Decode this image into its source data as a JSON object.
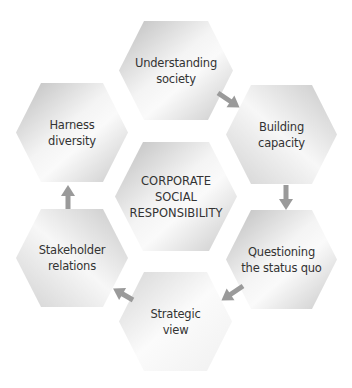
{
  "diagram": {
    "center": {
      "lines": [
        "CORPORATE",
        "SOCIAL",
        "RESPONSIBILITY"
      ]
    },
    "nodes": [
      {
        "id": "understanding-society",
        "lines": [
          "Understanding",
          "society"
        ]
      },
      {
        "id": "building-capacity",
        "lines": [
          "Building",
          "capacity"
        ]
      },
      {
        "id": "questioning-status-quo",
        "lines": [
          "Questioning",
          "the status quo"
        ]
      },
      {
        "id": "strategic-view",
        "lines": [
          "Strategic",
          "view"
        ]
      },
      {
        "id": "stakeholder-relations",
        "lines": [
          "Stakeholder",
          "relations"
        ]
      },
      {
        "id": "harness-diversity",
        "lines": [
          "Harness",
          "diversity"
        ]
      }
    ],
    "arrows": [
      {
        "from": "understanding-society",
        "to": "building-capacity"
      },
      {
        "from": "building-capacity",
        "to": "questioning-status-quo"
      },
      {
        "from": "questioning-status-quo",
        "to": "strategic-view"
      },
      {
        "from": "strategic-view",
        "to": "stakeholder-relations"
      },
      {
        "from": "stakeholder-relations",
        "to": "harness-diversity"
      }
    ],
    "colors": {
      "hex_light": "#fbfbfb",
      "hex_dark": "#c4c4c4",
      "arrow": "#9a9a9a",
      "text": "#333333"
    }
  }
}
